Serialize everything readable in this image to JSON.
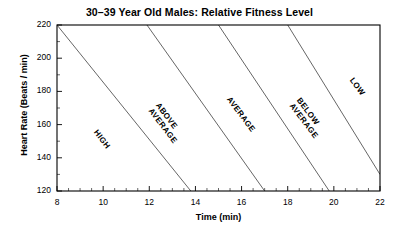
{
  "chart_data": {
    "type": "line",
    "title": "30–39 Year Old Males:  Relative Fitness Level",
    "xlabel": "Time (min)",
    "ylabel": "Heart Rate (Beats / min)",
    "xlim": [
      8,
      22
    ],
    "ylim": [
      120,
      220
    ],
    "xticks": [
      8,
      10,
      12,
      14,
      16,
      18,
      20,
      22
    ],
    "yticks": [
      220,
      200,
      180,
      160,
      140,
      120
    ],
    "xtick_labels": [
      "8",
      "10",
      "12",
      "14",
      "16",
      "18",
      "20",
      "22"
    ],
    "ytick_labels": [
      "220",
      "200",
      "180",
      "160",
      "140",
      "120"
    ],
    "x_minor_step": 0.5,
    "y_minor_step": 10,
    "grid": false,
    "legend": "none",
    "line_color": "#555555",
    "axis_color": "#000000",
    "background": "#ffffff",
    "series": [
      {
        "name": "boundary-high-aboveaverage",
        "x": [
          8,
          13.8
        ],
        "y": [
          220,
          120
        ]
      },
      {
        "name": "boundary-aboveaverage-average",
        "x": [
          11.9,
          17.0
        ],
        "y": [
          220,
          120
        ]
      },
      {
        "name": "boundary-average-belowaverage",
        "x": [
          15.0,
          19.8
        ],
        "y": [
          220,
          120
        ]
      },
      {
        "name": "boundary-belowaverage-low",
        "x": [
          18.0,
          22.0
        ],
        "y": [
          220,
          130
        ]
      }
    ],
    "annotations": [
      {
        "name": "zone-high",
        "text": "HIGH",
        "lines": [
          "HIGH"
        ],
        "x": 9.8,
        "y": 158,
        "rotation": 53
      },
      {
        "name": "zone-above-average",
        "text": "ABOVE AVERAGE",
        "lines": [
          "ABOVE",
          "AVERAGE"
        ],
        "x": 12.5,
        "y": 174,
        "rotation": 53
      },
      {
        "name": "zone-average",
        "text": "AVERAGE",
        "lines": [
          "AVERAGE"
        ],
        "x": 15.6,
        "y": 178,
        "rotation": 53
      },
      {
        "name": "zone-below-average",
        "text": "BELOW AVERAGE",
        "lines": [
          "BELOW",
          "AVERAGE"
        ],
        "x": 18.6,
        "y": 177,
        "rotation": 53
      },
      {
        "name": "zone-low",
        "text": "LOW",
        "lines": [
          "LOW"
        ],
        "x": 20.9,
        "y": 189,
        "rotation": 53
      }
    ]
  }
}
